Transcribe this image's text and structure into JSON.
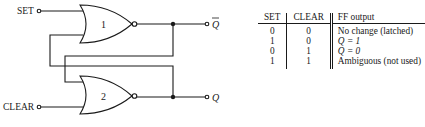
{
  "diagram": {
    "inputs": {
      "set_label": "SET",
      "clear_label": "CLEAR"
    },
    "gates": [
      {
        "id": "gate-1",
        "label": "1",
        "type": "NOR"
      },
      {
        "id": "gate-2",
        "label": "2",
        "type": "NOR"
      }
    ],
    "outputs": {
      "top_label": "Q",
      "top_inverted": true,
      "bottom_label": "Q",
      "bottom_inverted": false
    }
  },
  "truth_table": {
    "headers": {
      "set": "SET",
      "clear": "CLEAR",
      "output": "FF output"
    },
    "rows": [
      {
        "set": "0",
        "clear": "0",
        "output": "No change (latched)"
      },
      {
        "set": "1",
        "clear": "0",
        "output": "Q = 1"
      },
      {
        "set": "0",
        "clear": "1",
        "output": "Q = 0"
      },
      {
        "set": "1",
        "clear": "1",
        "output": "Ambiguous (not used)"
      }
    ]
  }
}
